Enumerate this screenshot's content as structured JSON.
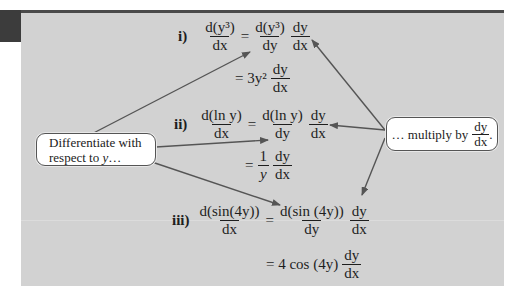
{
  "colors": {
    "panel_background": "#d2d2d2",
    "top_rule": "#4a4a4a",
    "corner_tab": "#3c3c3c",
    "arrow": "#555555",
    "callout_background": "#ffffff"
  },
  "equations": [
    {
      "label": "i)",
      "lhs": {
        "num": "d(y³)",
        "den": "dx"
      },
      "rhs_chain": [
        {
          "num": "d(y³)",
          "den": "dy"
        },
        {
          "num": "dy",
          "den": "dx"
        }
      ],
      "result": {
        "prefix": "= 3y²",
        "frac": {
          "num": "dy",
          "den": "dx"
        }
      }
    },
    {
      "label": "ii)",
      "lhs": {
        "num": "d(ln y)",
        "den": "dx"
      },
      "rhs_chain": [
        {
          "num": "d(ln y)",
          "den": "dy"
        },
        {
          "num": "dy",
          "den": "dx"
        }
      ],
      "result": {
        "prefix": "=",
        "coef": {
          "num": "1",
          "den": "y"
        },
        "frac": {
          "num": "dy",
          "den": "dx"
        }
      }
    },
    {
      "label": "iii)",
      "lhs": {
        "num": "d(sin(4y))",
        "den": "dx"
      },
      "rhs_chain": [
        {
          "num": "d(sin (4y))",
          "den": "dy"
        },
        {
          "num": "dy",
          "den": "dx"
        }
      ],
      "result": {
        "prefix": "= 4 cos (4y)",
        "frac": {
          "num": "dy",
          "den": "dx"
        }
      }
    }
  ],
  "equals": "=",
  "callouts": {
    "left": {
      "line1": "Differentiate with",
      "line2_prefix": "respect to ",
      "line2_var": "y",
      "line2_suffix": "…"
    },
    "right": {
      "prefix": "… multiply by",
      "frac": {
        "num": "dy",
        "den": "dx"
      },
      "suffix": "."
    }
  }
}
